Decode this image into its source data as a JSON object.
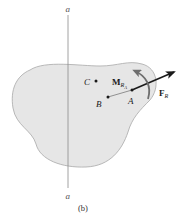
{
  "figure": {
    "caption": "(b)",
    "axis": {
      "top_label": "a",
      "bottom_label": "a"
    },
    "points": {
      "A": "A",
      "B": "B",
      "C": "C"
    },
    "force": {
      "symbol": "F",
      "subscript": "R"
    },
    "moment": {
      "symbol": "M",
      "subscript": "R",
      "sub_subscript": "A"
    }
  },
  "colors": {
    "body_fill": "#e6e6e6",
    "body_stroke": "#a8a8a8",
    "axis_line": "#8a8a8a",
    "ink": "#1a1a1a",
    "moment_arrow": "#6e6e6e"
  }
}
